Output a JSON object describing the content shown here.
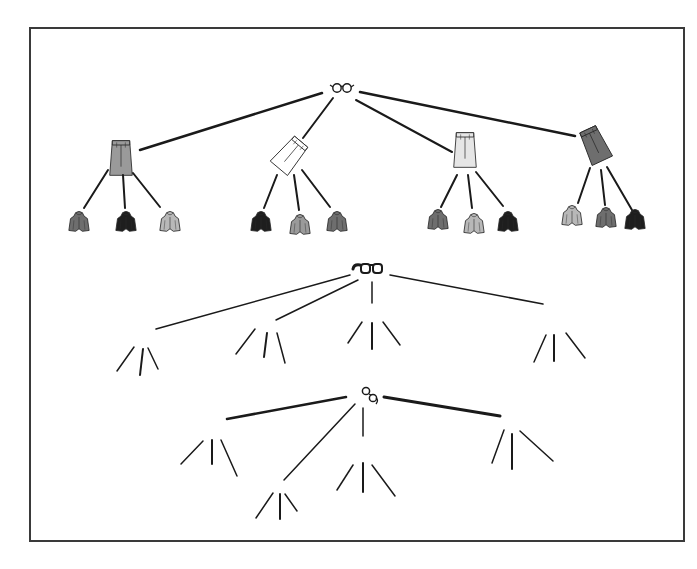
{
  "diagram": {
    "title": "",
    "frame": {
      "x": 30,
      "y": 28,
      "width": 654,
      "height": 513,
      "stroke": "#3a3a3a"
    },
    "colors": {
      "light": "#e6e6e6",
      "mid_light": "#b8b8b8",
      "mid": "#9a9a9a",
      "dark": "#6e6e6e",
      "black": "#1e1e1e",
      "white": "#ffffff"
    },
    "trees": [
      {
        "id": "top",
        "root": {
          "icon": "glasses-icon",
          "x": 342,
          "y": 87,
          "style": "round"
        },
        "children": [
          {
            "icon": "skirt-icon",
            "x": 121,
            "y": 158,
            "shade": "mid",
            "rotate": 0,
            "edge_from": [
              322,
              93
            ],
            "edge_to": [
              140,
              150
            ],
            "edge_width": 2.5,
            "leaves": [
              {
                "icon": "jacket-icon",
                "x": 79,
                "y": 222,
                "shade": "dark"
              },
              {
                "icon": "jacket-icon",
                "x": 126,
                "y": 222,
                "shade": "black"
              },
              {
                "icon": "jacket-icon",
                "x": 170,
                "y": 222,
                "shade": "mid_light"
              }
            ],
            "leaf_edges": [
              [
                108,
                170,
                84,
                208
              ],
              [
                123,
                175,
                125,
                208
              ],
              [
                133,
                173,
                160,
                207
              ]
            ]
          },
          {
            "icon": "skirt-icon",
            "x": 290,
            "y": 155,
            "shade": "white",
            "rotate": 40,
            "edge_from": [
              333,
              98
            ],
            "edge_to": [
              303,
              138
            ],
            "edge_width": 2,
            "leaves": [
              {
                "icon": "jacket-icon",
                "x": 261,
                "y": 222,
                "shade": "black"
              },
              {
                "icon": "jacket-icon",
                "x": 300,
                "y": 225,
                "shade": "mid"
              },
              {
                "icon": "jacket-icon",
                "x": 337,
                "y": 222,
                "shade": "dark"
              }
            ],
            "leaf_edges": [
              [
                277,
                175,
                264,
                208
              ],
              [
                294,
                175,
                299,
                210
              ],
              [
                302,
                170,
                330,
                207
              ]
            ]
          },
          {
            "icon": "skirt-icon",
            "x": 465,
            "y": 150,
            "shade": "light",
            "rotate": 0,
            "edge_from": [
              356,
              100
            ],
            "edge_to": [
              452,
              152
            ],
            "edge_width": 2,
            "leaves": [
              {
                "icon": "jacket-icon",
                "x": 438,
                "y": 220,
                "shade": "dark"
              },
              {
                "icon": "jacket-icon",
                "x": 474,
                "y": 224,
                "shade": "mid_light"
              },
              {
                "icon": "jacket-icon",
                "x": 508,
                "y": 222,
                "shade": "black"
              }
            ],
            "leaf_edges": [
              [
                457,
                175,
                441,
                207
              ],
              [
                468,
                175,
                472,
                208
              ],
              [
                476,
                172,
                503,
                206
              ]
            ]
          },
          {
            "icon": "skirt-icon",
            "x": 595,
            "y": 145,
            "shade": "dark",
            "rotate": -25,
            "edge_from": [
              360,
              92
            ],
            "edge_to": [
              575,
              136
            ],
            "edge_width": 2.5,
            "leaves": [
              {
                "icon": "jacket-icon",
                "x": 572,
                "y": 216,
                "shade": "mid_light"
              },
              {
                "icon": "jacket-icon",
                "x": 606,
                "y": 218,
                "shade": "dark"
              },
              {
                "icon": "jacket-icon",
                "x": 635,
                "y": 220,
                "shade": "black"
              }
            ],
            "leaf_edges": [
              [
                590,
                168,
                578,
                203
              ],
              [
                601,
                170,
                605,
                205
              ],
              [
                607,
                167,
                632,
                210
              ]
            ]
          }
        ]
      },
      {
        "id": "middle",
        "root": {
          "icon": "glasses-icon",
          "x": 372,
          "y": 268,
          "style": "square"
        },
        "children": [
          {
            "edge_from": [
              350,
              275
            ],
            "edge_to": [
              156,
              329
            ],
            "edge_width": 1.5,
            "stubs": [
              [
                134,
                347,
                117,
                371
              ],
              [
                143,
                349,
                140,
                375
              ],
              [
                148,
                348,
                158,
                369
              ]
            ]
          },
          {
            "edge_from": [
              358,
              280
            ],
            "edge_to": [
              276,
              320
            ],
            "edge_width": 1.5,
            "stubs": [
              [
                255,
                329,
                236,
                354
              ],
              [
                267,
                333,
                264,
                357
              ],
              [
                277,
                333,
                285,
                363
              ]
            ]
          },
          {
            "edge_from": [
              372,
              282
            ],
            "edge_to": [
              372,
              303
            ],
            "edge_width": 1.5,
            "stubs": [
              [
                362,
                322,
                348,
                343
              ],
              [
                372,
                323,
                372,
                349
              ],
              [
                383,
                322,
                400,
                345
              ]
            ]
          },
          {
            "edge_from": [
              390,
              275
            ],
            "edge_to": [
              543,
              304
            ],
            "edge_width": 1.5,
            "stubs": [
              [
                546,
                335,
                534,
                362
              ],
              [
                554,
                335,
                554,
                361
              ],
              [
                566,
                333,
                585,
                358
              ]
            ]
          }
        ]
      },
      {
        "id": "bottom",
        "root": {
          "icon": "glasses-icon",
          "x": 370,
          "y": 396,
          "style": "tilted"
        },
        "children": [
          {
            "edge_from": [
              346,
              397
            ],
            "edge_to": [
              227,
              419
            ],
            "edge_width": 2.5,
            "stubs": [
              [
                203,
                441,
                181,
                464
              ],
              [
                212,
                440,
                212,
                464
              ],
              [
                221,
                440,
                237,
                476
              ]
            ]
          },
          {
            "edge_from": [
              355,
              404
            ],
            "edge_to": [
              284,
              480
            ],
            "edge_width": 1.5,
            "stubs": [
              [
                273,
                493,
                256,
                518
              ],
              [
                280,
                494,
                280,
                519
              ],
              [
                285,
                494,
                297,
                511
              ]
            ]
          },
          {
            "edge_from": [
              363,
              408
            ],
            "edge_to": [
              363,
              436
            ],
            "edge_width": 1.5,
            "stubs": [
              [
                353,
                465,
                337,
                490
              ],
              [
                363,
                463,
                363,
                492
              ],
              [
                372,
                465,
                395,
                496
              ]
            ]
          },
          {
            "edge_from": [
              384,
              397
            ],
            "edge_to": [
              500,
              416
            ],
            "edge_width": 3,
            "stubs": [
              [
                504,
                430,
                492,
                463
              ],
              [
                512,
                434,
                512,
                469
              ],
              [
                520,
                431,
                553,
                461
              ]
            ]
          }
        ]
      }
    ]
  }
}
